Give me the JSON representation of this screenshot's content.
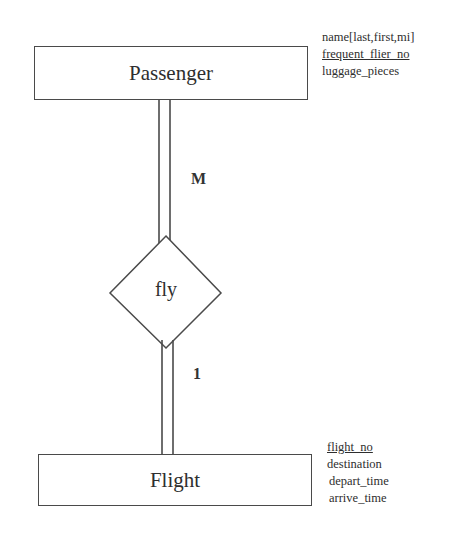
{
  "diagram": {
    "type": "er-diagram",
    "entities": [
      {
        "name": "Passenger",
        "attributes": [
          {
            "label": "name[last,first,mi]",
            "key": false
          },
          {
            "label": "frequent_flier_no",
            "key": true
          },
          {
            "label": "luggage_pieces",
            "key": false
          }
        ]
      },
      {
        "name": "Flight",
        "attributes": [
          {
            "label": "flight_no",
            "key": true
          },
          {
            "label": "destination",
            "key": false
          },
          {
            "label": "depart_time",
            "key": false
          },
          {
            "label": "arrive_time",
            "key": false
          }
        ]
      }
    ],
    "relationships": [
      {
        "name": "fly",
        "connections": [
          {
            "entity": "Passenger",
            "cardinality": "M",
            "participation": "total"
          },
          {
            "entity": "Flight",
            "cardinality": "1",
            "participation": "total"
          }
        ]
      }
    ],
    "colors": {
      "line": "#4a4a4a",
      "text": "#2e2e2e",
      "background": "#ffffff"
    }
  }
}
